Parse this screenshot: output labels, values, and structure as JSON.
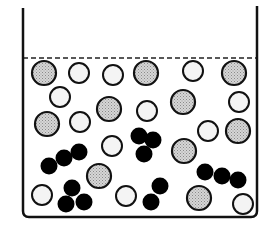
{
  "diagram": {
    "title": "Particles in a liquid-filled container",
    "container": {
      "left_wall_x": 23,
      "right_wall_x": 257,
      "top_y": 8,
      "bottom_y": 217,
      "corner_radius": 6,
      "stroke": "#111111",
      "stroke_width": 2.5
    },
    "liquid_surface": {
      "y": 58,
      "style": "dashed",
      "stroke": "#222222"
    },
    "colors": {
      "gray_fill": "#c8c8c8",
      "white_fill": "#f4f4f4",
      "black_fill": "#000000",
      "outline": "#111111"
    },
    "gray_particles": [
      {
        "cx": 44,
        "cy": 73,
        "r": 12
      },
      {
        "cx": 146,
        "cy": 73,
        "r": 12
      },
      {
        "cx": 234,
        "cy": 73,
        "r": 12
      },
      {
        "cx": 109,
        "cy": 109,
        "r": 12
      },
      {
        "cx": 183,
        "cy": 102,
        "r": 12
      },
      {
        "cx": 47,
        "cy": 124,
        "r": 12
      },
      {
        "cx": 238,
        "cy": 131,
        "r": 12
      },
      {
        "cx": 184,
        "cy": 151,
        "r": 12
      },
      {
        "cx": 99,
        "cy": 176,
        "r": 12
      },
      {
        "cx": 199,
        "cy": 198,
        "r": 12
      }
    ],
    "white_particles": [
      {
        "cx": 79,
        "cy": 73,
        "r": 10
      },
      {
        "cx": 113,
        "cy": 75,
        "r": 10
      },
      {
        "cx": 193,
        "cy": 71,
        "r": 10
      },
      {
        "cx": 60,
        "cy": 97,
        "r": 10
      },
      {
        "cx": 239,
        "cy": 102,
        "r": 10
      },
      {
        "cx": 80,
        "cy": 122,
        "r": 10
      },
      {
        "cx": 147,
        "cy": 111,
        "r": 10
      },
      {
        "cx": 208,
        "cy": 131,
        "r": 10
      },
      {
        "cx": 112,
        "cy": 146,
        "r": 10
      },
      {
        "cx": 42,
        "cy": 195,
        "r": 10
      },
      {
        "cx": 126,
        "cy": 196,
        "r": 10
      },
      {
        "cx": 243,
        "cy": 204,
        "r": 10
      }
    ],
    "black_molecules": [
      {
        "atoms": [
          {
            "cx": 49,
            "cy": 166
          },
          {
            "cx": 64,
            "cy": 158
          },
          {
            "cx": 79,
            "cy": 152
          }
        ]
      },
      {
        "atoms": [
          {
            "cx": 139,
            "cy": 136
          },
          {
            "cx": 153,
            "cy": 140
          },
          {
            "cx": 144,
            "cy": 154
          }
        ]
      },
      {
        "atoms": [
          {
            "cx": 72,
            "cy": 188
          },
          {
            "cx": 66,
            "cy": 204
          },
          {
            "cx": 84,
            "cy": 202
          }
        ]
      },
      {
        "atoms": [
          {
            "cx": 160,
            "cy": 186
          },
          {
            "cx": 151,
            "cy": 202
          }
        ]
      },
      {
        "atoms": [
          {
            "cx": 205,
            "cy": 172
          },
          {
            "cx": 222,
            "cy": 176
          },
          {
            "cx": 238,
            "cy": 180
          }
        ]
      }
    ],
    "black_atom_radius": 8.5
  }
}
